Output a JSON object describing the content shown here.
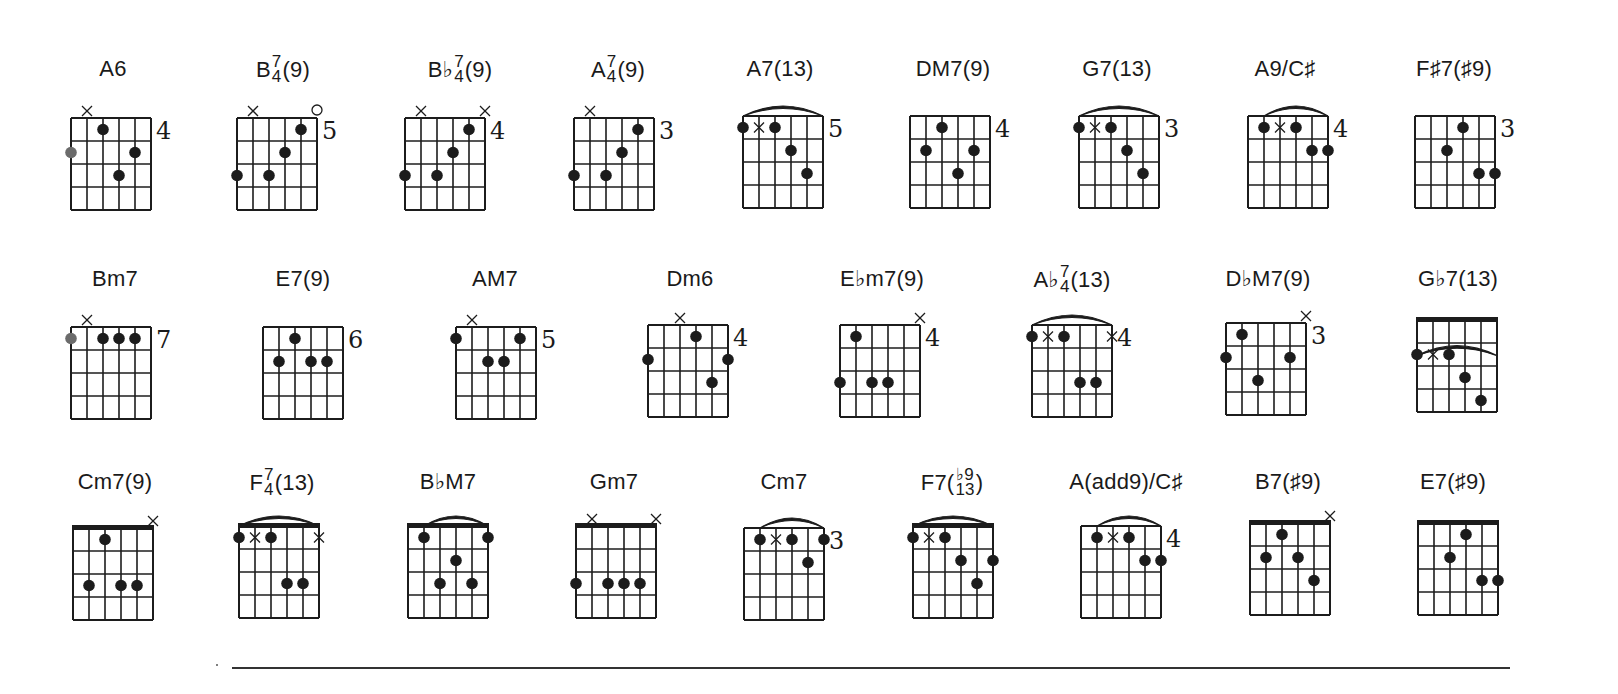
{
  "page": {
    "grid": {
      "strings": 6,
      "frets": 4
    }
  },
  "chords": [
    {
      "name": "A6",
      "fret": "4",
      "nut": "thin",
      "dots": [
        [
          3,
          1
        ],
        [
          4,
          3
        ],
        [
          5,
          2
        ]
      ],
      "gray_dots": [
        [
          1,
          2
        ]
      ],
      "x_top": [
        2
      ],
      "o_top": [],
      "x_in": [],
      "arc": null
    },
    {
      "name": "B",
      "stack": [
        "7",
        "4"
      ],
      "suffix": "(9)",
      "fret": "5",
      "nut": "thin",
      "dots": [
        [
          5,
          1
        ],
        [
          4,
          2
        ],
        [
          1,
          3
        ],
        [
          3,
          3
        ]
      ],
      "gray_dots": [],
      "x_top": [
        2
      ],
      "o_top": [
        6
      ],
      "x_in": [],
      "arc": null
    },
    {
      "name": "B♭",
      "stack": [
        "7",
        "4"
      ],
      "suffix": "(9)",
      "fret": "4",
      "nut": "thin",
      "dots": [
        [
          5,
          1
        ],
        [
          4,
          2
        ],
        [
          1,
          3
        ],
        [
          3,
          3
        ]
      ],
      "gray_dots": [],
      "x_top": [
        2,
        6
      ],
      "o_top": [],
      "x_in": [],
      "arc": null
    },
    {
      "name": "A",
      "stack": [
        "7",
        "4"
      ],
      "suffix": "(9)",
      "fret": "3",
      "nut": "thin",
      "dots": [
        [
          5,
          1
        ],
        [
          4,
          2
        ],
        [
          1,
          3
        ],
        [
          3,
          3
        ]
      ],
      "gray_dots": [],
      "x_top": [
        2
      ],
      "o_top": [],
      "x_in": [],
      "arc": null
    },
    {
      "name": "A7(13)",
      "fret": "5",
      "nut": "thin",
      "dots": [
        [
          1,
          1
        ],
        [
          3,
          1
        ],
        [
          4,
          2
        ],
        [
          5,
          3
        ]
      ],
      "gray_dots": [],
      "x_top": [],
      "o_top": [],
      "x_in": [
        [
          2,
          1
        ]
      ],
      "arc": {
        "from": 1,
        "to": 6,
        "row": 0
      }
    },
    {
      "name": "DM7(9)",
      "fret": "4",
      "nut": "thin",
      "dots": [
        [
          3,
          1
        ],
        [
          2,
          2
        ],
        [
          5,
          2
        ],
        [
          4,
          3
        ]
      ],
      "gray_dots": [],
      "x_top": [],
      "o_top": [],
      "x_in": [],
      "arc": null
    },
    {
      "name": "G7(13)",
      "fret": "3",
      "nut": "thin",
      "dots": [
        [
          1,
          1
        ],
        [
          3,
          1
        ],
        [
          4,
          2
        ],
        [
          5,
          3
        ]
      ],
      "gray_dots": [],
      "x_top": [],
      "o_top": [],
      "x_in": [
        [
          2,
          1
        ]
      ],
      "arc": {
        "from": 1,
        "to": 6,
        "row": 0
      }
    },
    {
      "name": "A9/C♯",
      "fret": "4",
      "nut": "thin",
      "dots": [
        [
          2,
          1
        ],
        [
          4,
          1
        ],
        [
          5,
          2
        ],
        [
          6,
          2
        ]
      ],
      "gray_dots": [],
      "x_top": [],
      "o_top": [],
      "x_in": [
        [
          3,
          1
        ]
      ],
      "arc": {
        "from": 2,
        "to": 6,
        "row": 0
      }
    },
    {
      "name": "F♯7(♯9)",
      "fret": "3",
      "nut": "thin",
      "dots": [
        [
          4,
          1
        ],
        [
          3,
          2
        ],
        [
          5,
          3
        ],
        [
          6,
          3
        ]
      ],
      "gray_dots": [],
      "x_top": [],
      "o_top": [],
      "x_in": [],
      "arc": null
    },
    {
      "name": "Bm7",
      "fret": "7",
      "nut": "thin",
      "dots": [
        [
          3,
          1
        ],
        [
          4,
          1
        ],
        [
          5,
          1
        ]
      ],
      "gray_dots": [
        [
          1,
          1
        ]
      ],
      "x_top": [
        2
      ],
      "o_top": [],
      "x_in": [],
      "arc": null
    },
    {
      "name": "E7(9)",
      "fret": "6",
      "nut": "thin",
      "dots": [
        [
          3,
          1
        ],
        [
          2,
          2
        ],
        [
          4,
          2
        ],
        [
          5,
          2
        ]
      ],
      "gray_dots": [],
      "x_top": [],
      "o_top": [],
      "x_in": [],
      "arc": null
    },
    {
      "name": "AM7",
      "fret": "5",
      "nut": "thin",
      "dots": [
        [
          1,
          1
        ],
        [
          5,
          1
        ],
        [
          3,
          2
        ],
        [
          4,
          2
        ]
      ],
      "gray_dots": [],
      "x_top": [
        2
      ],
      "o_top": [],
      "x_in": [],
      "arc": null
    },
    {
      "name": "Dm6",
      "fret": "4",
      "nut": "thin",
      "dots": [
        [
          4,
          1
        ],
        [
          1,
          2
        ],
        [
          6,
          2
        ],
        [
          5,
          3
        ]
      ],
      "gray_dots": [],
      "x_top": [
        3
      ],
      "o_top": [],
      "x_in": [],
      "arc": null
    },
    {
      "name": "E♭m7(9)",
      "fret": "4",
      "nut": "thin",
      "dots": [
        [
          2,
          1
        ],
        [
          1,
          3
        ],
        [
          3,
          3
        ],
        [
          4,
          3
        ]
      ],
      "gray_dots": [],
      "x_top": [
        6
      ],
      "o_top": [],
      "x_in": [],
      "arc": null
    },
    {
      "name": "A♭",
      "stack": [
        "7",
        "4"
      ],
      "suffix": "(13)",
      "fret": "4",
      "nut": "thin",
      "dots": [
        [
          1,
          1
        ],
        [
          3,
          1
        ],
        [
          4,
          3
        ],
        [
          5,
          3
        ]
      ],
      "gray_dots": [],
      "x_top": [],
      "o_top": [],
      "x_in": [
        [
          2,
          1
        ],
        [
          6,
          1
        ]
      ],
      "arc": {
        "from": 1,
        "to": 6,
        "row": 0
      }
    },
    {
      "name": "D♭M7(9)",
      "fret": "3",
      "nut": "thin",
      "dots": [
        [
          2,
          1
        ],
        [
          1,
          2
        ],
        [
          5,
          2
        ],
        [
          3,
          3
        ]
      ],
      "gray_dots": [],
      "x_top": [
        6
      ],
      "o_top": [],
      "x_in": [],
      "arc": null
    },
    {
      "name": "G♭7(13)",
      "fret": "",
      "nut": "thick",
      "dots": [
        [
          1,
          2
        ],
        [
          3,
          2
        ],
        [
          4,
          3
        ],
        [
          5,
          4
        ]
      ],
      "gray_dots": [],
      "x_top": [],
      "o_top": [],
      "x_in": [
        [
          2,
          2
        ]
      ],
      "arc": {
        "from": 1,
        "to": 6,
        "row": 1
      }
    },
    {
      "name": "Cm7(9)",
      "fret": "",
      "nut": "thick",
      "dots": [
        [
          3,
          1
        ],
        [
          2,
          3
        ],
        [
          4,
          3
        ],
        [
          5,
          3
        ]
      ],
      "gray_dots": [],
      "x_top": [
        6
      ],
      "o_top": [],
      "x_in": [],
      "arc": null
    },
    {
      "name": "F",
      "stack": [
        "7",
        "4"
      ],
      "suffix": "(13)",
      "fret": "",
      "nut": "thick",
      "dots": [
        [
          1,
          1
        ],
        [
          3,
          1
        ],
        [
          4,
          3
        ],
        [
          5,
          3
        ]
      ],
      "gray_dots": [],
      "x_top": [],
      "o_top": [],
      "x_in": [
        [
          2,
          1
        ],
        [
          6,
          1
        ]
      ],
      "arc": {
        "from": 1,
        "to": 6,
        "row": 0
      }
    },
    {
      "name": "B♭M7",
      "fret": "",
      "nut": "thick",
      "dots": [
        [
          2,
          1
        ],
        [
          6,
          1
        ],
        [
          4,
          2
        ],
        [
          3,
          3
        ],
        [
          5,
          3
        ]
      ],
      "gray_dots": [],
      "x_top": [],
      "o_top": [],
      "x_in": [],
      "arc": {
        "from": 2,
        "to": 6,
        "row": 0
      }
    },
    {
      "name": "Gm7",
      "fret": "",
      "nut": "thick",
      "dots": [
        [
          1,
          3
        ],
        [
          3,
          3
        ],
        [
          4,
          3
        ],
        [
          5,
          3
        ]
      ],
      "gray_dots": [],
      "x_top": [
        2,
        6
      ],
      "o_top": [],
      "x_in": [],
      "arc": null
    },
    {
      "name": "Cm7",
      "fret": "3",
      "nut": "thin",
      "dots": [
        [
          2,
          1
        ],
        [
          4,
          1
        ],
        [
          6,
          1
        ],
        [
          5,
          2
        ]
      ],
      "gray_dots": [],
      "x_top": [],
      "o_top": [],
      "x_in": [
        [
          3,
          1
        ]
      ],
      "arc": {
        "from": 2,
        "to": 6,
        "row": 0
      }
    },
    {
      "name": "F7(",
      "stack": [
        "♭9",
        "13"
      ],
      "suffix": ")",
      "fret": "",
      "nut": "thick",
      "dots": [
        [
          1,
          1
        ],
        [
          3,
          1
        ],
        [
          4,
          2
        ],
        [
          6,
          2
        ],
        [
          5,
          3
        ]
      ],
      "gray_dots": [],
      "x_top": [],
      "o_top": [],
      "x_in": [
        [
          2,
          1
        ]
      ],
      "arc": {
        "from": 1,
        "to": 6,
        "row": 0
      }
    },
    {
      "name": "A(add9)/C♯",
      "fret": "4",
      "nut": "thin",
      "dots": [
        [
          2,
          1
        ],
        [
          4,
          1
        ],
        [
          5,
          2
        ],
        [
          6,
          2
        ]
      ],
      "gray_dots": [],
      "x_top": [],
      "o_top": [],
      "x_in": [
        [
          3,
          1
        ]
      ],
      "arc": {
        "from": 2,
        "to": 6,
        "row": 0
      }
    },
    {
      "name": "B7(♯9)",
      "fret": "",
      "nut": "thick",
      "dots": [
        [
          3,
          1
        ],
        [
          2,
          2
        ],
        [
          4,
          2
        ],
        [
          5,
          3
        ]
      ],
      "gray_dots": [],
      "x_top": [
        6
      ],
      "o_top": [],
      "x_in": [],
      "arc": null
    },
    {
      "name": "E7(♯9)",
      "fret": "",
      "nut": "thick",
      "dots": [
        [
          4,
          1
        ],
        [
          3,
          2
        ],
        [
          5,
          3
        ],
        [
          6,
          3
        ]
      ],
      "gray_dots": [],
      "x_top": [],
      "o_top": [],
      "x_in": [],
      "arc": null
    }
  ],
  "layout": {
    "positions": [
      [
        71,
        118
      ],
      [
        237,
        118
      ],
      [
        405,
        118
      ],
      [
        574,
        118
      ],
      [
        743,
        116
      ],
      [
        910,
        116
      ],
      [
        1079,
        116
      ],
      [
        1248,
        116
      ],
      [
        1415,
        116
      ],
      [
        71,
        327
      ],
      [
        263,
        327
      ],
      [
        456,
        327
      ],
      [
        648,
        325
      ],
      [
        840,
        325
      ],
      [
        1032,
        325
      ],
      [
        1226,
        323
      ],
      [
        1417,
        320
      ],
      [
        73,
        528
      ],
      [
        239,
        526
      ],
      [
        408,
        526
      ],
      [
        576,
        526
      ],
      [
        744,
        528
      ],
      [
        913,
        526
      ],
      [
        1081,
        526
      ],
      [
        1250,
        523
      ],
      [
        1418,
        523
      ]
    ],
    "title_centers": [
      [
        113,
        70
      ],
      [
        283,
        70
      ],
      [
        460,
        70
      ],
      [
        618,
        70
      ],
      [
        780,
        70
      ],
      [
        953,
        70
      ],
      [
        1117,
        70
      ],
      [
        1285,
        70
      ],
      [
        1454,
        70
      ],
      [
        115,
        280
      ],
      [
        303,
        280
      ],
      [
        495,
        280
      ],
      [
        690,
        280
      ],
      [
        882,
        280
      ],
      [
        1072,
        280
      ],
      [
        1268,
        280
      ],
      [
        1458,
        280
      ],
      [
        115,
        483
      ],
      [
        282,
        483
      ],
      [
        448,
        483
      ],
      [
        614,
        483
      ],
      [
        784,
        483
      ],
      [
        952,
        483
      ],
      [
        1126,
        483
      ],
      [
        1288,
        483
      ],
      [
        1453,
        483
      ]
    ]
  }
}
